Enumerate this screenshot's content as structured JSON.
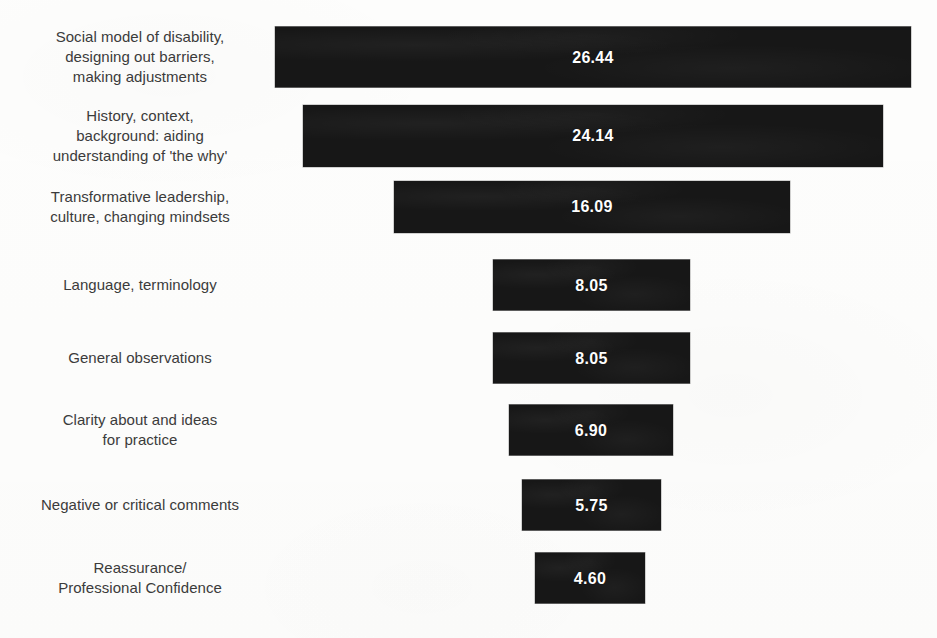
{
  "chart_data": {
    "type": "bar",
    "orientation": "horizontal",
    "layout": "funnel-centered",
    "title": "",
    "subtitle": "",
    "xlabel": "",
    "ylabel": "",
    "grid": false,
    "legend": null,
    "axis_visible": false,
    "value_label_format": "2-decimal",
    "bar_color": "#171717",
    "value_text_color": "#ffffff",
    "label_text_color": "#3b3b3b",
    "background_color": "#fdfdfc",
    "categories": [
      "Social model of disability,\ndesigning out barriers,\nmaking adjustments",
      "History, context,\nbackground: aiding\nunderstanding of 'the why'",
      "Transformative leadership,\nculture, changing mindsets",
      "Language, terminology",
      "General observations",
      "Clarity about and ideas\nfor practice",
      "Negative or critical comments",
      "Reassurance/\nProfessional Confidence"
    ],
    "values": [
      26.44,
      24.14,
      16.09,
      8.05,
      8.05,
      6.9,
      5.75,
      4.6
    ],
    "value_labels": [
      "26.44",
      "24.14",
      "16.09",
      "8.05",
      "8.05",
      "6.90",
      "5.75",
      "4.60"
    ],
    "xlim": [
      0,
      26.44
    ]
  },
  "bars": [
    {
      "label": "Social model of disability,\ndesigning out barriers,\nmaking adjustments",
      "value_label": "26.44",
      "left": 275,
      "width": 636,
      "center_y": 57,
      "height": 61
    },
    {
      "label": "History, context,\nbackground: aiding\nunderstanding of 'the why'",
      "value_label": "24.14",
      "left": 303,
      "width": 580,
      "center_y": 136,
      "height": 62
    },
    {
      "label": "Transformative leadership,\nculture, changing mindsets",
      "value_label": "16.09",
      "left": 394,
      "width": 396,
      "center_y": 207,
      "height": 52
    },
    {
      "label": "Language, terminology",
      "value_label": "8.05",
      "left": 493,
      "width": 197,
      "center_y": 285,
      "height": 51
    },
    {
      "label": "General observations",
      "value_label": "8.05",
      "left": 493,
      "width": 197,
      "center_y": 358,
      "height": 51
    },
    {
      "label": "Clarity about and ideas\nfor practice",
      "value_label": "6.90",
      "left": 509,
      "width": 164,
      "center_y": 430,
      "height": 51
    },
    {
      "label": "Negative or critical comments",
      "value_label": "5.75",
      "left": 522,
      "width": 139,
      "center_y": 505,
      "height": 51
    },
    {
      "label": "Reassurance/\nProfessional Confidence",
      "value_label": "4.60",
      "left": 535,
      "width": 110,
      "center_y": 578,
      "height": 51
    }
  ]
}
